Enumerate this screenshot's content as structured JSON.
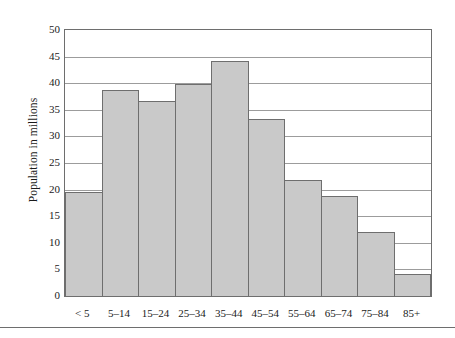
{
  "chart_data": {
    "type": "bar",
    "title": "",
    "subtitle": "",
    "xlabel": "",
    "ylabel": "Population in millions",
    "categories": [
      "< 5",
      "5–14",
      "15–24",
      "25–34",
      "35–44",
      "45–54",
      "55–64",
      "65–74",
      "75–84",
      "85+"
    ],
    "values": [
      19.5,
      38.7,
      36.6,
      39.8,
      44.2,
      33.3,
      21.8,
      18.8,
      12.1,
      4.2
    ],
    "ylim": [
      0,
      50
    ],
    "ytick_values": [
      0,
      5,
      10,
      15,
      20,
      25,
      30,
      35,
      40,
      45,
      50
    ],
    "ytick_labels": [
      "0",
      "5",
      "10",
      "15",
      "20",
      "25",
      "30",
      "35",
      "40",
      "45",
      "50"
    ],
    "ystep": 5,
    "grid": true,
    "grid_axis": "y",
    "legend": false,
    "legend_position": "none",
    "bar_gap": 0,
    "colors": {
      "bar_fill": "#c9c9c9",
      "bar_border": "#6e6e6e",
      "gridline": "#9c9c9c",
      "frame": "#6e6e6e",
      "text": "#1a1a1a",
      "background": "#ffffff",
      "rule": "#6e6e6e"
    }
  }
}
